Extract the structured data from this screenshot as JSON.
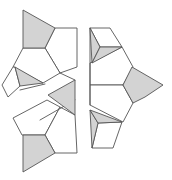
{
  "diagram": {
    "title": "",
    "width": 172,
    "height": 180,
    "colors": {
      "background": "#ffffff",
      "stroke": "#555555",
      "shade": "#d3d3d3"
    },
    "shaded_faces": [
      {
        "name": "top-left-shaded-quad",
        "points": "23,10 55,28 45,48 23,48"
      },
      {
        "name": "left-mid-shaded-triangle",
        "points": "15,67 43,83 20,86"
      },
      {
        "name": "center-shaded-triangle",
        "points": "48,95 75,80 75,115"
      },
      {
        "name": "bottom-left-shaded-quad",
        "points": "23,135 45,135 55,153 23,172"
      },
      {
        "name": "top-right-shaded-left-triangle",
        "points": "90,28 100,47 92,63"
      },
      {
        "name": "top-right-shaded-lower-triangle",
        "points": "100,47 122,47 92,63"
      },
      {
        "name": "right-shaded-pentagon",
        "points": "132,67 163,85 145,97 133,103 123,85"
      },
      {
        "name": "bottom-right-shaded-left-triangle",
        "points": "90,110 98,123 92,148"
      },
      {
        "name": "bottom-right-shaded-top-triangle",
        "points": "90,110 122,122 98,123"
      }
    ],
    "outline_faces": [
      {
        "name": "top-left-pentagon",
        "points": "55,28 77,28 77,67 60,73 45,48"
      },
      {
        "name": "left-pentagon",
        "points": "23,48 45,48 60,73 43,83 13,67"
      },
      {
        "name": "far-left-quad",
        "points": "13,67 2,85 8,97 20,86 15,67"
      },
      {
        "name": "bottom-left-pentagon",
        "points": "13,118 22,135 45,135 60,107 47,100"
      },
      {
        "name": "bottom-left-right-pentagon",
        "points": "45,135 60,107 75,115 77,153 55,153"
      },
      {
        "name": "top-right-cube-top",
        "points": "90,28 110,28 122,47 100,47"
      },
      {
        "name": "right-upper-pentagon",
        "points": "90,63 122,47 133,67 123,85 90,85"
      },
      {
        "name": "right-lower-pentagon",
        "points": "90,85 123,85 133,103 123,122 90,105"
      },
      {
        "name": "bottom-right-cube-front",
        "points": "98,123 122,122 113,148 92,148"
      }
    ],
    "edges": [
      {
        "name": "gap-line-left",
        "points": "20,90 45,84"
      },
      {
        "name": "gap-line-mid",
        "points": "40,120 75,100"
      },
      {
        "name": "center-divider-upper",
        "points": "60,73 75,80"
      },
      {
        "name": "right-vertical-top",
        "points": "90,28 90,105"
      }
    ]
  }
}
